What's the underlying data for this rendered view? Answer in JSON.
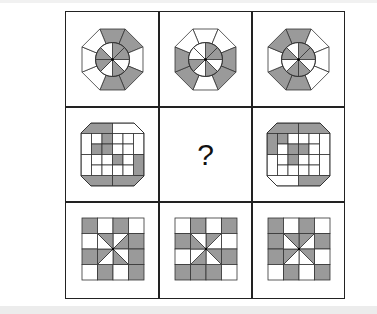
{
  "puzzle": {
    "question_mark": "?",
    "colors": {
      "shade": "#9a9a9a",
      "line": "#333333",
      "bg": "#ffffff"
    },
    "row1": [
      {
        "rim": [
          1,
          1,
          0,
          1,
          1,
          0,
          0,
          0
        ],
        "inner": [
          1,
          1,
          0,
          1,
          0,
          1,
          1,
          0
        ]
      },
      {
        "rim": [
          0,
          0,
          1,
          1,
          0,
          1,
          1,
          0
        ],
        "inner": [
          1,
          1,
          0,
          1,
          0,
          1,
          0,
          0
        ]
      },
      {
        "rim": [
          1,
          0,
          0,
          0,
          1,
          1,
          0,
          1
        ],
        "inner": [
          1,
          1,
          0,
          1,
          1,
          0,
          1,
          0
        ]
      }
    ],
    "row2": [
      {
        "outer": [
          1,
          0,
          0,
          1,
          1,
          1,
          0,
          0
        ],
        "inner": [
          0,
          1,
          0,
          0,
          1,
          1,
          0,
          0,
          0,
          0,
          1,
          0,
          0,
          0,
          0,
          0
        ]
      },
      null,
      {
        "outer": [
          1,
          1,
          0,
          0,
          1,
          0,
          0,
          1
        ],
        "inner": [
          1,
          0,
          0,
          0,
          0,
          1,
          1,
          0,
          0,
          1,
          0,
          0,
          0,
          0,
          0,
          0
        ]
      }
    ],
    "row3": [
      {
        "cells": [
          1,
          0,
          1,
          0,
          0,
          9,
          9,
          1,
          1,
          9,
          9,
          1,
          0,
          1,
          0,
          1
        ],
        "tri": [
          0,
          1,
          0,
          1,
          0,
          1,
          0,
          1
        ]
      },
      {
        "cells": [
          0,
          1,
          0,
          1,
          1,
          9,
          9,
          0,
          0,
          9,
          9,
          1,
          1,
          1,
          1,
          0
        ],
        "tri": [
          1,
          0,
          1,
          0,
          1,
          0,
          1,
          0
        ]
      },
      {
        "cells": [
          1,
          0,
          1,
          0,
          1,
          9,
          9,
          1,
          1,
          9,
          9,
          0,
          0,
          1,
          0,
          1
        ],
        "tri": [
          1,
          0,
          1,
          0,
          0,
          1,
          0,
          1
        ]
      }
    ]
  }
}
